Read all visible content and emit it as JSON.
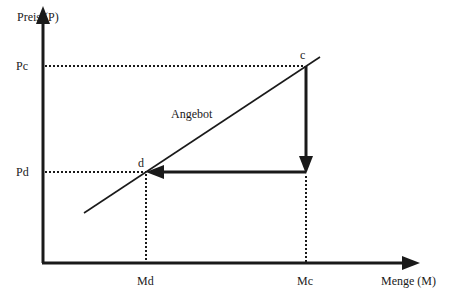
{
  "diagram": {
    "y_axis_label": "Preis (P)",
    "x_axis_label": "Menge (M)",
    "curve_label": "Angebot",
    "price_ticks": [
      {
        "label": "Pc",
        "y": 66
      },
      {
        "label": "Pd",
        "y": 172
      }
    ],
    "quantity_ticks": [
      {
        "label": "Md",
        "x": 146
      },
      {
        "label": "Mc",
        "x": 306
      }
    ],
    "points": [
      {
        "label": "c",
        "x": 306,
        "y": 66
      },
      {
        "label": "d",
        "x": 146,
        "y": 172
      }
    ],
    "colors": {
      "ink": "#1a1a1a",
      "background": "#ffffff"
    }
  }
}
